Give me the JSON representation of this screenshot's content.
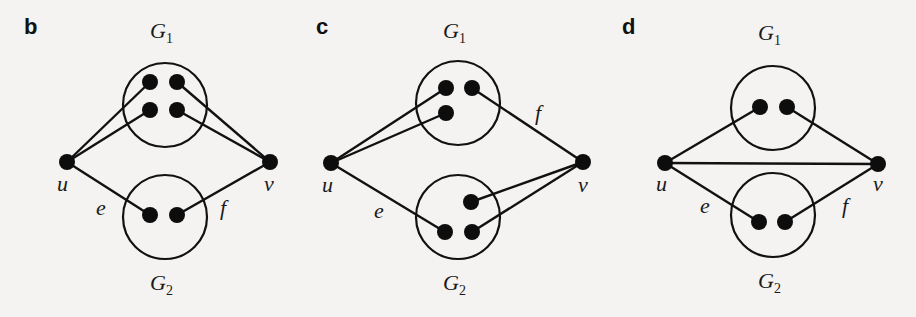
{
  "figure": {
    "panels": [
      {
        "id": "b",
        "label": "b",
        "cluster_top_label": "G",
        "cluster_top_sub": "1",
        "cluster_bottom_label": "G",
        "cluster_bottom_sub": "2",
        "u_label": "u",
        "v_label": "v",
        "e_label": "e",
        "f_label": "f",
        "description": "u connects to two vertices of G1 and one vertex of G2 (edge e); v connects to two vertices of G1 and one vertex of G2 (edge f)"
      },
      {
        "id": "c",
        "label": "c",
        "cluster_top_label": "G",
        "cluster_top_sub": "1",
        "cluster_bottom_label": "G",
        "cluster_bottom_sub": "2",
        "u_label": "u",
        "v_label": "v",
        "e_label": "e",
        "f_label": "f",
        "description": "u connects to two vertices of G1 and one vertex of G2 (edge e); v connects to one vertex of G1 (edge f) and two vertices of G2"
      },
      {
        "id": "d",
        "label": "d",
        "cluster_top_label": "G",
        "cluster_top_sub": "1",
        "cluster_bottom_label": "G",
        "cluster_bottom_sub": "2",
        "u_label": "u",
        "v_label": "v",
        "e_label": "e",
        "f_label": "f",
        "description": "u and v are adjacent; u connects to one vertex of G1 and one of G2 (edge e); v connects to one vertex of G1 and one of G2 (edge f)"
      }
    ]
  }
}
